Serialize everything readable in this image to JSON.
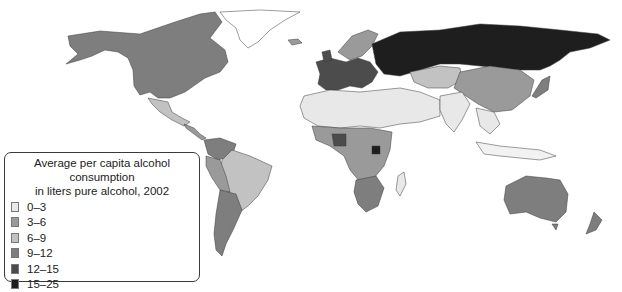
{
  "legend": {
    "title_line1": "Average per capita alcohol consumption",
    "title_line2": "in liters pure alcohol, 2002",
    "items": [
      {
        "label": "0–3",
        "color": "#e8e8e8"
      },
      {
        "label": "3–6",
        "color": "#9a9a9a"
      },
      {
        "label": "6–9",
        "color": "#c2c2c2"
      },
      {
        "label": "9–12",
        "color": "#7e7e7e"
      },
      {
        "label": "12–15",
        "color": "#4c4c4c"
      },
      {
        "label": "15–25",
        "color": "#1e1e1e"
      }
    ]
  },
  "regions": [
    {
      "name": "north-america",
      "bin": "9–12"
    },
    {
      "name": "mexico",
      "bin": "6–9"
    },
    {
      "name": "greenland",
      "bin": "none"
    },
    {
      "name": "south-america-brazil",
      "bin": "6–9"
    },
    {
      "name": "argentina",
      "bin": "9–12"
    },
    {
      "name": "western-europe",
      "bin": "12–15"
    },
    {
      "name": "russia",
      "bin": "15–25"
    },
    {
      "name": "north-africa-middle-east",
      "bin": "0–3"
    },
    {
      "name": "central-asia",
      "bin": "6–9"
    },
    {
      "name": "china",
      "bin": "3–6"
    },
    {
      "name": "south-asia",
      "bin": "0–3"
    },
    {
      "name": "sub-saharan-africa",
      "bin": "3–6"
    },
    {
      "name": "southern-africa",
      "bin": "9–12"
    },
    {
      "name": "australia",
      "bin": "9–12"
    },
    {
      "name": "new-zealand",
      "bin": "9–12"
    },
    {
      "name": "southeast-asia",
      "bin": "0–3"
    },
    {
      "name": "japan",
      "bin": "9–12"
    }
  ]
}
